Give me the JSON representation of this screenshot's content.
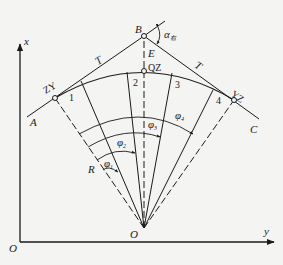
{
  "diagram": {
    "title": "",
    "axes": {
      "origin_label": "O",
      "x_label": "x",
      "y_label": "y"
    },
    "points": {
      "intersection": "B",
      "start_tangent": "A",
      "end_tangent": "C",
      "curve_start": "ZY",
      "curve_mid": "QZ",
      "curve_end": "YZ",
      "center": "O",
      "external_distance": "E"
    },
    "segments": {
      "tangent_left": "T",
      "tangent_right": "T",
      "radius": "R"
    },
    "deflection_angle": {
      "symbol": "α",
      "subscript": "右"
    },
    "stations": [
      "1",
      "2",
      "3",
      "4"
    ],
    "angles": [
      {
        "symbol": "φ",
        "subscript": "1"
      },
      {
        "symbol": "φ",
        "subscript": "2"
      },
      {
        "symbol": "φ",
        "subscript": "3"
      },
      {
        "symbol": "φ",
        "subscript": "4"
      }
    ],
    "colors": {
      "line": "#1a1a1a",
      "background": "#f4f4f2"
    }
  }
}
